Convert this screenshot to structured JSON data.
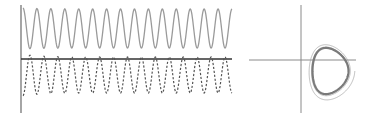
{
  "chart_data": [
    {
      "type": "line",
      "title": "",
      "xlabel": "",
      "ylabel": "",
      "grid": false,
      "legend": null,
      "description": "Time series: solid sinusoid (upper) and dashed sinusoid (lower), approx. 15 cycles",
      "series": [
        {
          "name": "solid",
          "style": "solid",
          "color": "#9a9a9a",
          "cycles": 15,
          "amplitude": 1.0,
          "offset": 1.0
        },
        {
          "name": "dashed",
          "style": "dashed",
          "color": "#555555",
          "cycles": 15,
          "amplitude": 1.0,
          "offset": -0.8
        }
      ]
    },
    {
      "type": "line",
      "title": "",
      "xlabel": "",
      "ylabel": "",
      "grid": false,
      "legend": null,
      "description": "Phase portrait: spiral trajectory converging to a closed limit cycle in the lower-right quadrant",
      "series": [
        {
          "name": "trajectory",
          "style": "solid",
          "color": "#808080",
          "shape": "limit-cycle"
        }
      ]
    }
  ]
}
